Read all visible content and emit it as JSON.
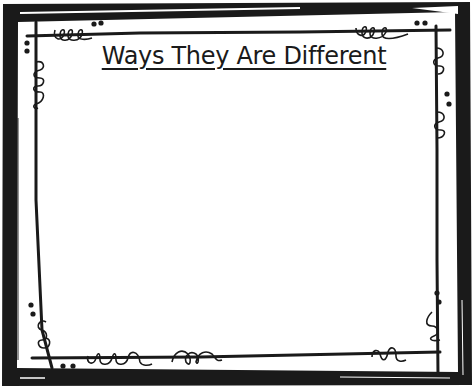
{
  "worksheet": {
    "title": "Ways They Are Different",
    "content_area": ""
  },
  "colors": {
    "frame": "#1a1a1a",
    "background": "#ffffff",
    "text": "#1a1a1a"
  },
  "decorations": {
    "corner_style": "doodle-loops-and-dots",
    "border_icon": "double-frame-border"
  }
}
